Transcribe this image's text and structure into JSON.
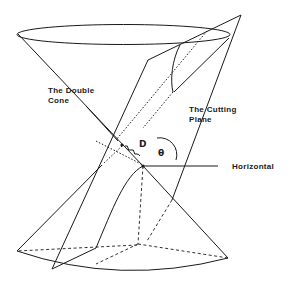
{
  "figure": {
    "labels": {
      "double_cone_line1": "The Double",
      "double_cone_line2": "Cone",
      "cutting_plane_line1": "The Cutting",
      "cutting_plane_line2": "Plane",
      "horizontal": "Horizontal",
      "distance": "D",
      "angle": "θ"
    },
    "colors": {
      "ink": "#1a1a1a",
      "background": "#ffffff"
    }
  }
}
